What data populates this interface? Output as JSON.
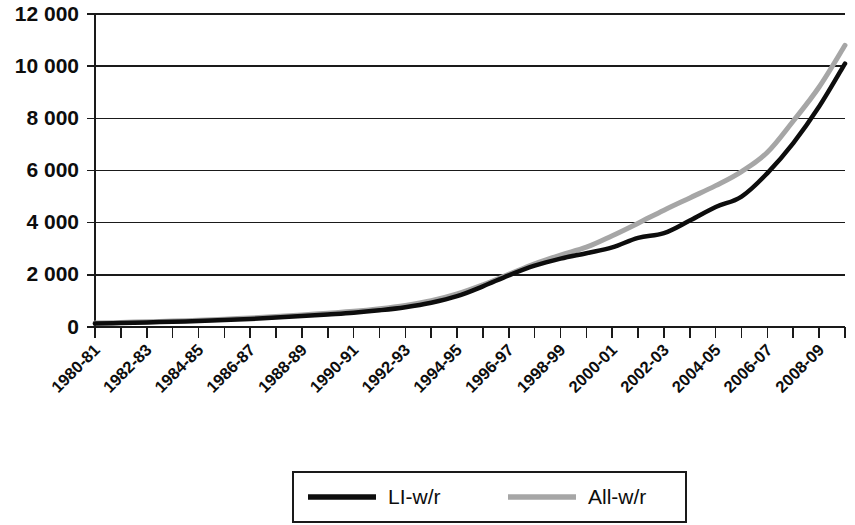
{
  "chart_data": {
    "type": "line",
    "title": "",
    "subtitle": "",
    "xlabel": "",
    "ylabel": "",
    "ylim": [
      0,
      12000
    ],
    "ytick_values": [
      0,
      2000,
      4000,
      6000,
      8000,
      10000,
      12000
    ],
    "ytick_labels": [
      "0",
      "2 000",
      "4 000",
      "6 000",
      "8 000",
      "10 000",
      "12 000"
    ],
    "grid": true,
    "grid_axis": "y",
    "legend_position": "bottom",
    "categories": [
      "1980-81",
      "1981-82",
      "1982-83",
      "1983-84",
      "1984-85",
      "1985-86",
      "1986-87",
      "1987-88",
      "1988-89",
      "1989-90",
      "1990-91",
      "1991-92",
      "1992-93",
      "1993-94",
      "1994-95",
      "1995-96",
      "1996-97",
      "1997-98",
      "1998-99",
      "1999-00",
      "2000-01",
      "2001-02",
      "2002-03",
      "2003-04",
      "2004-05",
      "2005-06",
      "2006-07",
      "2007-08",
      "2008-09",
      "2009-10"
    ],
    "xtick_labels_shown": [
      "1980-81",
      "1982-83",
      "1984-85",
      "1986-87",
      "1988-89",
      "1990-91",
      "1992-93",
      "1994-95",
      "1996-97",
      "1998-99",
      "2000-01",
      "2002-03",
      "2004-05",
      "2006-07",
      "2008-09"
    ],
    "xtick_label_rotation": -45,
    "series": [
      {
        "name": "LI-w/r",
        "color": "#0d0d0d",
        "line_width": 4.5,
        "values": [
          130,
          150,
          175,
          200,
          230,
          265,
          310,
          360,
          420,
          480,
          545,
          640,
          760,
          930,
          1180,
          1560,
          1980,
          2350,
          2620,
          2830,
          3050,
          3420,
          3600,
          4080,
          4600,
          5000,
          5900,
          7050,
          8450,
          10100
        ]
      },
      {
        "name": "All-w/r",
        "color": "#a6a6a6",
        "line_width": 5.0,
        "values": [
          150,
          175,
          200,
          228,
          262,
          300,
          345,
          400,
          465,
          530,
          600,
          700,
          830,
          1010,
          1270,
          1620,
          2020,
          2420,
          2760,
          3060,
          3500,
          3980,
          4480,
          4950,
          5420,
          5960,
          6700,
          7900,
          9200,
          10800
        ]
      }
    ],
    "legend_entries": [
      {
        "label": "LI-w/r",
        "swatch": "black-line",
        "color": "#0d0d0d"
      },
      {
        "label": "All-w/r",
        "swatch": "gray-line",
        "color": "#a6a6a6"
      }
    ]
  }
}
